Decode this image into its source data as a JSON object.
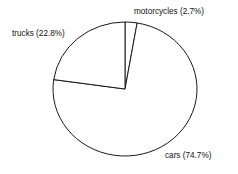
{
  "chart_data": {
    "type": "pie",
    "title": "",
    "categories": [
      "motorcycles",
      "cars",
      "trucks"
    ],
    "values": [
      2.7,
      74.7,
      22.8
    ],
    "value_unit": "percent",
    "labels": [
      "motorcycles (2.7%)",
      "cars (74.7%)",
      "trucks (22.8%)"
    ],
    "start_angle_deg": 90,
    "direction": "clockwise",
    "legend": "none",
    "grid": false,
    "slice_fill": "#ffffff",
    "slice_stroke": "#1a1a1a",
    "background": "#ffffff",
    "text_color": "#111111"
  },
  "geometry": {
    "cx": 125,
    "cy": 89,
    "rx": 72,
    "ry": 67
  },
  "label_positions": [
    {
      "key": "motorcycles",
      "x": 134,
      "y": 14,
      "anchor": "start"
    },
    {
      "key": "trucks",
      "x": 12,
      "y": 36,
      "anchor": "start"
    },
    {
      "key": "cars",
      "x": 165,
      "y": 158,
      "anchor": "start"
    }
  ]
}
